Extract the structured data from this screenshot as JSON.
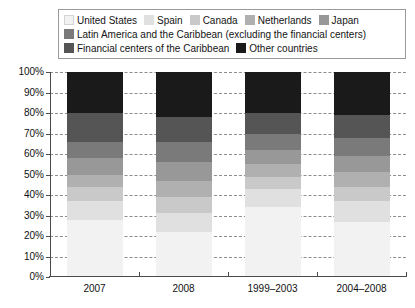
{
  "chart_data": {
    "type": "bar",
    "subtype": "stacked-100-percent",
    "title": "",
    "xlabel": "",
    "ylabel": "",
    "ylim": [
      0,
      100
    ],
    "ytick_labels": [
      "0%",
      "10%",
      "20%",
      "30%",
      "40%",
      "50%",
      "60%",
      "70%",
      "80%",
      "90%",
      "100%"
    ],
    "ytick_values": [
      0,
      10,
      20,
      30,
      40,
      50,
      60,
      70,
      80,
      90,
      100
    ],
    "grid": true,
    "grid_style": "dashed-horizontal",
    "legend_position": "top",
    "categories": [
      "2007",
      "2008",
      "1999–2003",
      "2004–2008"
    ],
    "series": [
      {
        "name": "United States",
        "color": "#f2f2f2",
        "values": [
          28,
          22,
          34,
          27
        ]
      },
      {
        "name": "Spain",
        "color": "#e0e0e0",
        "values": [
          9,
          9,
          9,
          10
        ]
      },
      {
        "name": "Canada",
        "color": "#c9c9c9",
        "values": [
          7,
          8,
          6,
          7
        ]
      },
      {
        "name": "Netherlands",
        "color": "#b0b0b0",
        "values": [
          6,
          8,
          6,
          7
        ]
      },
      {
        "name": "Japan",
        "color": "#989898",
        "values": [
          8,
          9,
          7,
          8
        ]
      },
      {
        "name": "Latin America and the Caribbean (excluding the financial centers)",
        "color": "#7a7a7a",
        "values": [
          8,
          10,
          8,
          9
        ]
      },
      {
        "name": "Financial centers of the Caribbean",
        "color": "#555555",
        "values": [
          14,
          12,
          10,
          11
        ]
      },
      {
        "name": "Other countries",
        "color": "#1a1a1a",
        "values": [
          20,
          22,
          20,
          21
        ]
      }
    ]
  },
  "legend": {
    "rows": [
      [
        {
          "label": "United States",
          "color": "#f2f2f2"
        },
        {
          "label": "Spain",
          "color": "#e0e0e0"
        },
        {
          "label": "Canada",
          "color": "#c9c9c9"
        },
        {
          "label": "Netherlands",
          "color": "#b0b0b0"
        },
        {
          "label": "Japan",
          "color": "#989898"
        }
      ],
      [
        {
          "label": "Latin America and the Caribbean (excluding the financial centers)",
          "color": "#7a7a7a"
        }
      ],
      [
        {
          "label": "Financial centers of the Caribbean",
          "color": "#555555"
        },
        {
          "label": "Other countries",
          "color": "#1a1a1a"
        }
      ]
    ]
  },
  "colors": {
    "axis": "#4a4a4a",
    "gridline": "#8d8d8d",
    "legend_border": "#9a9a9a",
    "text": "#111111",
    "background": "#ffffff"
  }
}
